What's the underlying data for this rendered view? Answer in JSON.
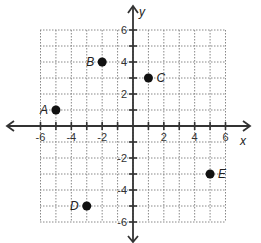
{
  "chart_data": {
    "type": "scatter",
    "title": "",
    "xlabel": "x",
    "ylabel": "y",
    "xlim": [
      -6,
      6
    ],
    "ylim": [
      -6,
      6
    ],
    "grid": true,
    "grid_style": "dotted",
    "x_tick_labels": [
      "-6",
      "-4",
      "-2",
      "2",
      "4",
      "6"
    ],
    "y_tick_labels": [
      "6",
      "4",
      "2",
      "-2",
      "-4",
      "-6"
    ],
    "points": [
      {
        "label": "A",
        "x": -5,
        "y": 1
      },
      {
        "label": "B",
        "x": -2,
        "y": 4
      },
      {
        "label": "C",
        "x": 1,
        "y": 3
      },
      {
        "label": "D",
        "x": -3,
        "y": -5
      },
      {
        "label": "E",
        "x": 5,
        "y": -3
      }
    ]
  },
  "colors": {
    "axis": "#333333",
    "grid": "#888888",
    "point": "#111111"
  }
}
